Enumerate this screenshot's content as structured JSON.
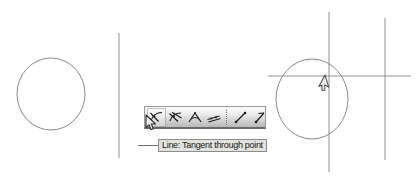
{
  "app": {
    "title": "Geometry construction canvas",
    "background_color": "#ffffff",
    "width": 417,
    "height": 176
  },
  "canvas": {
    "name": "drawing-area",
    "stroke_color": "#8a8a8a",
    "shapes": [
      {
        "kind": "circle",
        "name": "circle-left",
        "cx": 51,
        "cy": 94,
        "rx": 34,
        "ry": 36
      },
      {
        "kind": "line",
        "name": "vertical-line-left",
        "x1": 119,
        "y1": 33,
        "x2": 119,
        "y2": 158
      },
      {
        "kind": "circle",
        "name": "circle-right",
        "cx": 312,
        "cy": 99,
        "rx": 36,
        "ry": 40
      },
      {
        "kind": "line",
        "name": "vertical-line-center",
        "x1": 329,
        "y1": 12,
        "x2": 329,
        "y2": 172
      },
      {
        "kind": "line",
        "name": "vertical-line-right",
        "x1": 385,
        "y1": 18,
        "x2": 385,
        "y2": 160
      },
      {
        "kind": "line",
        "name": "horizontal-line",
        "x1": 268,
        "y1": 76,
        "x2": 411,
        "y2": 76
      }
    ]
  },
  "toolbar": {
    "name": "line-tools-toolbar",
    "background_start": "#fbfbfb",
    "background_end": "#b9b9b9",
    "border_color": "#9a9a9a",
    "selected_index": 0,
    "tools": [
      {
        "icon": "tangent-through-point-icon",
        "label": "Line: Tangent through point",
        "selected": true
      },
      {
        "icon": "line-through-two-points-icon",
        "label": "Line through two points",
        "selected": false
      },
      {
        "icon": "angle-bisector-icon",
        "label": "Angle bisector",
        "selected": false
      },
      {
        "icon": "parallel-lines-icon",
        "label": "Parallel line",
        "selected": false
      },
      {
        "icon": "segment-icon",
        "label": "Segment",
        "selected": false
      },
      {
        "icon": "ray-icon",
        "label": "Ray",
        "selected": false
      }
    ],
    "separator": {
      "icon": "dotted-separator-icon"
    }
  },
  "tooltip": {
    "name": "tool-tooltip",
    "text": "Line: Tangent through point",
    "background_color": "#e2e2de",
    "border_color": "#8c8c8c",
    "text_color": "#1a1a1a"
  },
  "cursors": [
    {
      "name": "mouse-cursor-toolbar",
      "x": 149,
      "y": 117,
      "color": "#f2f2f2",
      "outline": "#333333"
    },
    {
      "name": "mouse-cursor-canvas",
      "x": 327,
      "y": 76,
      "color": "#f2f2f2",
      "outline": "#4a4a4a"
    }
  ]
}
